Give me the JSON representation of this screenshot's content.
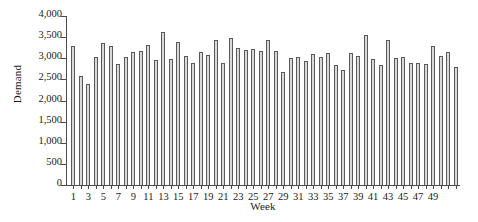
{
  "chart_data": {
    "type": "bar",
    "title": "",
    "xlabel": "Week",
    "ylabel": "Demand",
    "ylim": [
      0,
      4000
    ],
    "ytick_labels": [
      "0",
      "500",
      "1,000",
      "1,500",
      "2,000",
      "2,500",
      "3,000",
      "3,500",
      "4,000"
    ],
    "ytick_values": [
      0,
      500,
      1000,
      1500,
      2000,
      2500,
      3000,
      3500,
      4000
    ],
    "xtick_labels": [
      "1",
      "3",
      "5",
      "7",
      "9",
      "11",
      "13",
      "15",
      "17",
      "19",
      "21",
      "23",
      "25",
      "27",
      "29",
      "31",
      "33",
      "35",
      "37",
      "39",
      "41",
      "43",
      "45",
      "47",
      "49"
    ],
    "grid": false,
    "legend": false,
    "bar_fill_color": "#d9d9d9",
    "bar_edge_color": "#595959",
    "axis_color": "#4a4a4a",
    "categories": [
      1,
      2,
      3,
      4,
      5,
      6,
      7,
      8,
      9,
      10,
      11,
      12,
      13,
      14,
      15,
      16,
      17,
      18,
      19,
      20,
      21,
      22,
      23,
      24,
      25,
      26,
      27,
      28,
      29,
      30,
      31,
      32,
      33,
      34,
      35,
      36,
      37,
      38,
      39,
      40,
      41,
      42,
      43,
      44,
      45,
      46,
      47,
      48,
      49,
      50,
      51,
      52
    ],
    "values": [
      3290,
      2590,
      2400,
      3040,
      3370,
      3300,
      2870,
      3020,
      3140,
      3160,
      3310,
      2950,
      3620,
      2990,
      3390,
      3050,
      2880,
      3150,
      3080,
      3440,
      2880,
      3480,
      3240,
      3190,
      3210,
      3180,
      3430,
      3180,
      2680,
      3000,
      3030,
      2940,
      3100,
      3040,
      3120,
      2840,
      2720,
      3120,
      3060,
      3540,
      2990,
      2830,
      3430,
      3010,
      3030,
      2880,
      2890,
      2870,
      3290,
      3060,
      3140,
      2800
    ]
  }
}
